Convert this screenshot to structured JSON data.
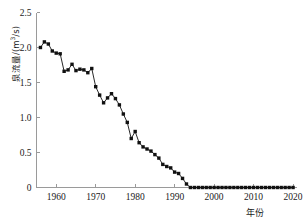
{
  "chart_data": {
    "type": "line",
    "title": "",
    "xlabel": "年份",
    "ylabel": "泉流量/(m³/s)",
    "ylabel_parts": {
      "name": "泉流量",
      "sep": "/(m",
      "exp": "3",
      "unit": "/s)"
    },
    "xlim": [
      1955,
      2021
    ],
    "ylim": [
      0,
      2.5
    ],
    "xticks": [
      1960,
      1970,
      1980,
      1990,
      2000,
      2010,
      2020
    ],
    "yticks": [
      0,
      0.5,
      1.0,
      1.5,
      2.0,
      2.5
    ],
    "xticklabels": [
      "1960",
      "1970",
      "1980",
      "1990",
      "2000",
      "2010",
      "2020"
    ],
    "yticklabels": [
      "0",
      "0.5",
      "1.0",
      "1.5",
      "2.0",
      "2.5"
    ],
    "grid": false,
    "legend": null,
    "marker": "square",
    "series_color": "#111111",
    "axis_color": "#9a9a9a",
    "series": [
      {
        "name": "泉流量",
        "x": [
          1956,
          1957,
          1958,
          1959,
          1960,
          1961,
          1962,
          1963,
          1964,
          1965,
          1966,
          1967,
          1968,
          1969,
          1970,
          1971,
          1972,
          1973,
          1974,
          1975,
          1976,
          1977,
          1978,
          1979,
          1980,
          1981,
          1982,
          1983,
          1984,
          1985,
          1986,
          1987,
          1988,
          1989,
          1990,
          1991,
          1992,
          1993,
          1994,
          1995,
          1996,
          1997,
          1998,
          1999,
          2000,
          2001,
          2002,
          2003,
          2004,
          2005,
          2006,
          2007,
          2008,
          2009,
          2010,
          2011,
          2012,
          2013,
          2014,
          2015,
          2016,
          2017,
          2018,
          2019,
          2020
        ],
        "values": [
          2.0,
          2.08,
          2.05,
          1.95,
          1.92,
          1.91,
          1.66,
          1.68,
          1.76,
          1.67,
          1.69,
          1.68,
          1.64,
          1.7,
          1.44,
          1.32,
          1.21,
          1.28,
          1.34,
          1.27,
          1.18,
          1.05,
          0.93,
          0.7,
          0.8,
          0.64,
          0.58,
          0.55,
          0.52,
          0.47,
          0.42,
          0.33,
          0.3,
          0.28,
          0.22,
          0.2,
          0.13,
          0.05,
          0.0,
          0.0,
          0.0,
          0.0,
          0.0,
          0.0,
          0.0,
          0.0,
          0.0,
          0.0,
          0.0,
          0.0,
          0.0,
          0.0,
          0.0,
          0.0,
          0.0,
          0.0,
          0.0,
          0.0,
          0.0,
          0.0,
          0.0,
          0.0,
          0.0,
          0.0,
          0.0
        ]
      }
    ]
  }
}
